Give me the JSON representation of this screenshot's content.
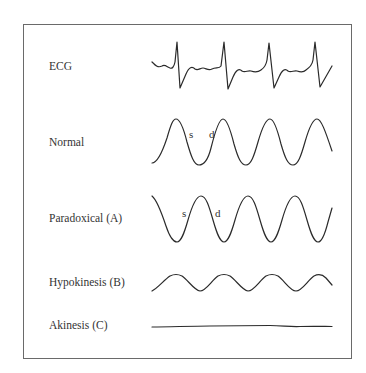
{
  "rows": [
    {
      "id": "ecg",
      "label": "ECG"
    },
    {
      "id": "normal",
      "label": "Normal",
      "annotations": [
        "s",
        "d"
      ]
    },
    {
      "id": "paradoxical",
      "label": "Paradoxical (A)",
      "annotations": [
        "s",
        "d"
      ]
    },
    {
      "id": "hypokinesis",
      "label": "Hypokinesis (B)"
    },
    {
      "id": "akinesis",
      "label": "Akinesis (C)"
    }
  ],
  "annotations": {
    "systole": "s",
    "diastole": "d"
  },
  "colors": {
    "line": "#2b2b2b",
    "frame": "#6a6a6a",
    "text": "#333333",
    "background": "#ffffff"
  }
}
